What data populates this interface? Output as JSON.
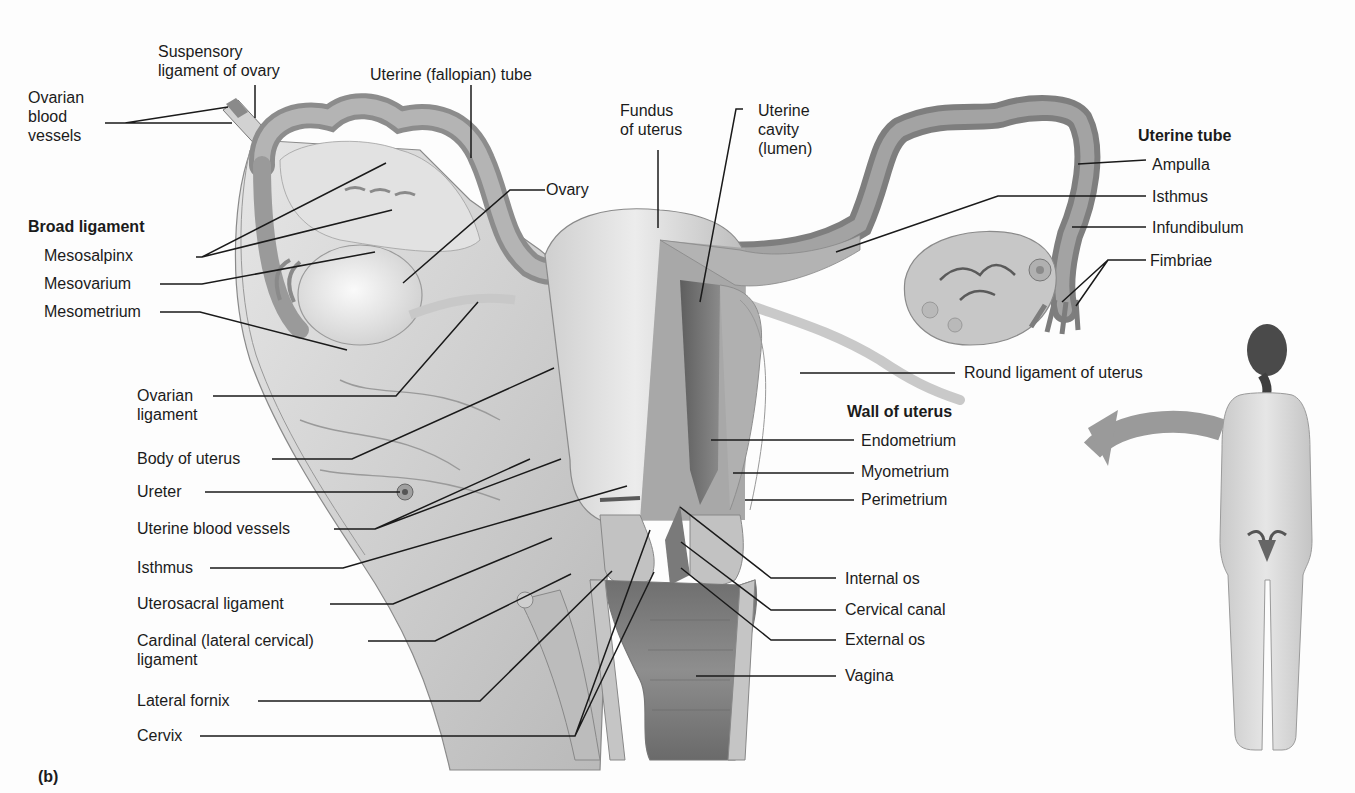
{
  "figure": {
    "panel_label": "(b)",
    "colors": {
      "background": "#fdfdfd",
      "label_text": "#1b1b1b",
      "leader_line": "#1a1a1a",
      "tissue_light": "#d8d8d8",
      "tissue_dark": "#6b6b6b",
      "arrow": "#9a9a9a"
    }
  },
  "labels": {
    "suspensory_ligament": [
      "Suspensory",
      "ligament of ovary"
    ],
    "ovarian_blood_vessels": [
      "Ovarian",
      "blood",
      "vessels"
    ],
    "uterine_fallopian_tube": "Uterine (fallopian) tube",
    "fundus": [
      "Fundus",
      "of uterus"
    ],
    "uterine_cavity": [
      "Uterine",
      "cavity",
      "(lumen)"
    ],
    "ovary": "Ovary",
    "broad_ligament_header": "Broad ligament",
    "mesosalpinx": "Mesosalpinx",
    "mesovarium": "Mesovarium",
    "mesometrium": "Mesometrium",
    "ovarian_ligament": [
      "Ovarian",
      "ligament"
    ],
    "body_of_uterus": "Body of uterus",
    "ureter": "Ureter",
    "uterine_blood_vessels": "Uterine blood vessels",
    "isthmus_left": "Isthmus",
    "uterosacral_ligament": "Uterosacral ligament",
    "cardinal_ligament": [
      "Cardinal (lateral cervical)",
      "ligament"
    ],
    "lateral_fornix": "Lateral fornix",
    "cervix": "Cervix",
    "uterine_tube_header": "Uterine tube",
    "ampulla": "Ampulla",
    "isthmus_right": "Isthmus",
    "infundibulum": "Infundibulum",
    "fimbriae": "Fimbriae",
    "round_ligament": "Round ligament of uterus",
    "wall_of_uterus_header": "Wall of uterus",
    "endometrium": "Endometrium",
    "myometrium": "Myometrium",
    "perimetrium": "Perimetrium",
    "internal_os": "Internal os",
    "cervical_canal": "Cervical canal",
    "external_os": "External os",
    "vagina": "Vagina"
  }
}
